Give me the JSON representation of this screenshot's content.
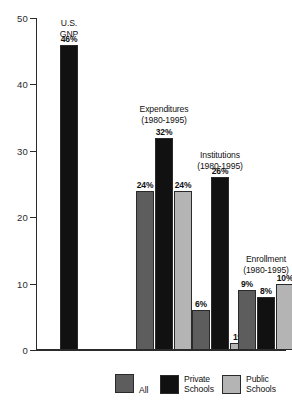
{
  "chart_data": {
    "type": "bar",
    "title": "",
    "xlabel": "",
    "ylabel": "",
    "ylim": [
      0,
      50
    ],
    "ytick_labels": [
      "0",
      "10",
      "20",
      "30",
      "40",
      "50"
    ],
    "ytick_values": [
      0,
      10,
      20,
      30,
      40,
      50
    ],
    "grid": false,
    "legend_position": "bottom",
    "series": [
      {
        "name": "All",
        "color": "#5d5d5d"
      },
      {
        "name": "Private Schools",
        "color": "#111111"
      },
      {
        "name": "Public Schools",
        "color": "#b4b4b4"
      }
    ],
    "groups": [
      {
        "title_line1": "U.S.",
        "title_line2": "GNP",
        "bars": [
          {
            "series": "Private Schools",
            "value": 46,
            "label": "46%",
            "color": "#111111"
          }
        ]
      },
      {
        "title_line1": "Expenditures",
        "title_line2": "(1980-1995)",
        "bars": [
          {
            "series": "All",
            "value": 24,
            "label": "24%",
            "color": "#5d5d5d"
          },
          {
            "series": "Private Schools",
            "value": 32,
            "label": "32%",
            "color": "#111111"
          },
          {
            "series": "Public Schools",
            "value": 24,
            "label": "24%",
            "color": "#b4b4b4"
          }
        ]
      },
      {
        "title_line1": "Institutions",
        "title_line2": "(1980-1995)",
        "bars": [
          {
            "series": "All",
            "value": 6,
            "label": "6%",
            "color": "#5d5d5d"
          },
          {
            "series": "Private Schools",
            "value": 26,
            "label": "26%",
            "color": "#111111"
          },
          {
            "series": "Public Schools",
            "value": 1,
            "label": "1%",
            "color": "#b4b4b4"
          }
        ]
      },
      {
        "title_line1": "Enrollment",
        "title_line2": "(1980-1995)",
        "bars": [
          {
            "series": "All",
            "value": 9,
            "label": "9%",
            "color": "#5d5d5d"
          },
          {
            "series": "Private Schools",
            "value": 8,
            "label": "8%",
            "color": "#111111"
          },
          {
            "series": "Public Schools",
            "value": 10,
            "label": "10%",
            "color": "#b4b4b4"
          }
        ]
      }
    ]
  },
  "axis": {
    "ticks": [
      {
        "label": "50",
        "value": 50
      },
      {
        "label": "40",
        "value": 40
      },
      {
        "label": "30",
        "value": 30
      },
      {
        "label": "20",
        "value": 20
      },
      {
        "label": "10",
        "value": 10
      },
      {
        "label": "0",
        "value": 0
      }
    ]
  },
  "legend": {
    "items": [
      {
        "label": "All",
        "color": "#5d5d5d"
      },
      {
        "label": "Private\nSchools",
        "color": "#111111"
      },
      {
        "label": "Public\nSchools",
        "color": "#b4b4b4"
      }
    ]
  }
}
